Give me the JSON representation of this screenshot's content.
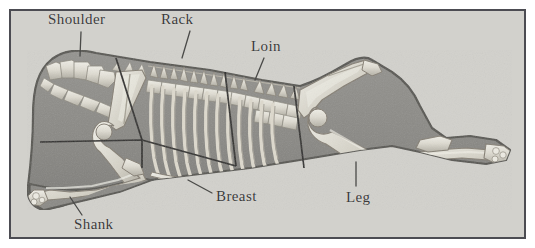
{
  "figure": {
    "caption_present": false
  },
  "colors": {
    "page_background": "#ffffff",
    "panel_background": "#d2d1cc",
    "panel_border": "#4c4c52",
    "body_fill": "#8b8a86",
    "body_outline": "#585752",
    "bone_light": "#e6e4dc",
    "bone_mid": "#c9c6bb",
    "bone_shadow": "#9a978d",
    "cut_line": "#2e2d2b",
    "label_text": "#3b3b3b",
    "leader_line": "#4a4a48"
  },
  "panel": {
    "x": 9,
    "y": 9,
    "width": 517,
    "height": 230,
    "border_width": 2
  },
  "labels": [
    {
      "id": "shoulder",
      "text": "Shoulder",
      "x": 48,
      "y": 11,
      "leader": {
        "x1": 81,
        "y1": 32,
        "x2": 80,
        "y2": 56
      }
    },
    {
      "id": "rack",
      "text": "Rack",
      "x": 161,
      "y": 11,
      "leader": {
        "x1": 190,
        "y1": 31,
        "x2": 182,
        "y2": 58
      }
    },
    {
      "id": "loin",
      "text": "Loin",
      "x": 251,
      "y": 38,
      "leader": {
        "x1": 264,
        "y1": 58,
        "x2": 255,
        "y2": 80
      }
    },
    {
      "id": "breast",
      "text": "Breast",
      "x": 216,
      "y": 188,
      "leader": {
        "x1": 212,
        "y1": 193,
        "x2": 188,
        "y2": 180
      }
    },
    {
      "id": "shank",
      "text": "Shank",
      "x": 74,
      "y": 216,
      "leader": {
        "x1": 82,
        "y1": 215,
        "x2": 70,
        "y2": 197
      }
    },
    {
      "id": "leg",
      "text": "Leg",
      "x": 346,
      "y": 189,
      "leader": {
        "x1": 356,
        "y1": 186,
        "x2": 356,
        "y2": 162
      }
    }
  ],
  "primal_cuts": [
    {
      "name": "Shoulder"
    },
    {
      "name": "Rack"
    },
    {
      "name": "Loin"
    },
    {
      "name": "Leg"
    },
    {
      "name": "Breast"
    },
    {
      "name": "Shank"
    }
  ]
}
